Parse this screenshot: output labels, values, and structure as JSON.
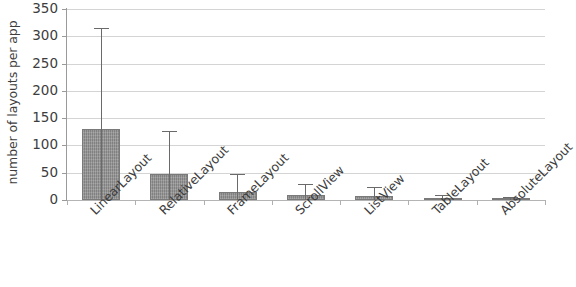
{
  "chart_data": {
    "type": "bar",
    "title": "",
    "subtitle": "",
    "xlabel": "",
    "ylabel": "number of layouts per app",
    "categories": [
      "LinearLayout",
      "RelativeLayout",
      "FrameLayout",
      "ScrollView",
      "ListView",
      "TableLayout",
      "AbsoluteLayout"
    ],
    "values": [
      130,
      48,
      14,
      9,
      7,
      2,
      1.5
    ],
    "error_upper": [
      313,
      125,
      45,
      27,
      22,
      8,
      4
    ],
    "ylim": [
      0,
      350
    ],
    "ytick_values": [
      0,
      50,
      100,
      150,
      200,
      250,
      300,
      350
    ],
    "ytick_labels": [
      "0",
      "50",
      "100",
      "150",
      "200",
      "250",
      "300",
      "350"
    ],
    "grid": true,
    "legend": false,
    "legend_position": "none",
    "bar_color": "#8d8d8d",
    "error_bar_color": "#6a6a6a",
    "gridline_color": "#d4d4d4",
    "axis_color": "#9a9a9a",
    "error_bar_style": "upper-only-whisker"
  }
}
